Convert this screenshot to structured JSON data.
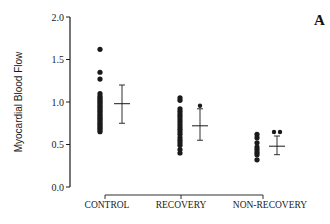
{
  "panel_label": "A",
  "chart_data": {
    "type": "scatter",
    "title": "",
    "xlabel": "",
    "ylabel": "Myocardial Blood Flow",
    "ylim": [
      0.0,
      2.0
    ],
    "yticks": [
      "0.0",
      "0.5",
      "1.0",
      "1.5",
      "2.0"
    ],
    "grid": false,
    "categories": [
      "CONTROL",
      "RECOVERY",
      "NON-RECOVERY"
    ],
    "series": [
      {
        "name": "CONTROL",
        "points": [
          1.62,
          1.35,
          1.27,
          1.1,
          1.07,
          1.05,
          1.03,
          1.01,
          0.99,
          0.97,
          0.95,
          0.93,
          0.91,
          0.89,
          0.87,
          0.85,
          0.83,
          0.81,
          0.79,
          0.77,
          0.75,
          0.73,
          0.71,
          0.69,
          0.67,
          0.65
        ],
        "mean": 0.98,
        "error_upper": 1.2,
        "error_lower": 0.75
      },
      {
        "name": "RECOVERY",
        "points": [
          1.05,
          1.02,
          0.92,
          0.89,
          0.86,
          0.83,
          0.8,
          0.77,
          0.74,
          0.71,
          0.68,
          0.65,
          0.62,
          0.58,
          0.55,
          0.52,
          0.49,
          0.44,
          0.4
        ],
        "mean": 0.72,
        "error_upper": 0.92,
        "error_lower": 0.55,
        "marker_above_error": 0.95
      },
      {
        "name": "NON-RECOVERY",
        "points": [
          0.62,
          0.58,
          0.52,
          0.47,
          0.44,
          0.41,
          0.38,
          0.32
        ],
        "mean": 0.48,
        "error_upper": 0.6,
        "error_lower": 0.38,
        "markers_above_error": 2
      }
    ],
    "significance_bracket": {
      "from": "CONTROL",
      "to": "NON-RECOVERY",
      "mid_tick": "RECOVERY"
    }
  }
}
